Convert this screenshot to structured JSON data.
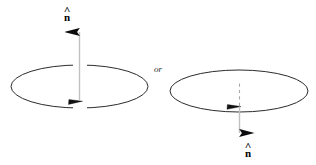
{
  "figure": {
    "background_color": "#ffffff",
    "stroke_color": "#1a1a1a",
    "shaft_color": "#b9b9b9",
    "dash_color": "#9a9a9a",
    "conjunction": "or",
    "left_panel": {
      "name": "normal-up-diagram",
      "loop_label": "",
      "normal_label": "n",
      "normal_hat": "^",
      "normal_direction": "up",
      "ellipse": {
        "cx": 79.5,
        "cy": 86.5,
        "rx": 68.5,
        "ry": 21.5
      },
      "arrow": {
        "x": 79.5,
        "y_start": 100,
        "y_end": 18
      },
      "circulation_arrow": {
        "x": 78,
        "y": 102,
        "direction": "right"
      }
    },
    "right_panel": {
      "name": "normal-down-diagram",
      "loop_label": "",
      "normal_label": "n",
      "normal_hat": "^",
      "normal_direction": "down",
      "ellipse": {
        "cx": 239,
        "cy": 91,
        "rx": 69,
        "ry": 21
      },
      "arrow": {
        "x": 239.5,
        "y_start": 107,
        "y_end": 147
      },
      "dashed_segment": {
        "x": 239.5,
        "y_start": 84,
        "y_end": 106
      },
      "circulation_arrow": {
        "x": 236,
        "y": 107,
        "direction": "right"
      }
    }
  }
}
